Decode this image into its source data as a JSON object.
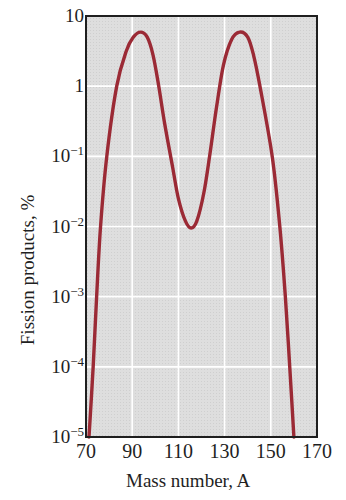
{
  "chart_data": {
    "type": "line",
    "title": "",
    "xlabel": "Mass number, A",
    "ylabel": "Fission products, %",
    "xscale": "linear",
    "yscale": "log",
    "xlim": [
      70,
      170
    ],
    "ylim": [
      1e-05,
      10
    ],
    "grid": true,
    "legend": "none",
    "x_ticks": [
      {
        "value": 70,
        "label": "70"
      },
      {
        "value": 90,
        "label": "90"
      },
      {
        "value": 110,
        "label": "110"
      },
      {
        "value": 130,
        "label": "130"
      },
      {
        "value": 150,
        "label": "150"
      },
      {
        "value": 170,
        "label": "170"
      }
    ],
    "y_ticks": [
      {
        "value": 10,
        "base": "10",
        "exp": ""
      },
      {
        "value": 1,
        "base": "1",
        "exp": ""
      },
      {
        "value": 0.1,
        "base": "10",
        "exp": "−1"
      },
      {
        "value": 0.01,
        "base": "10",
        "exp": "−2"
      },
      {
        "value": 0.001,
        "base": "10",
        "exp": "−3"
      },
      {
        "value": 0.0001,
        "base": "10",
        "exp": "−4"
      },
      {
        "value": 1e-05,
        "base": "10",
        "exp": "−5"
      }
    ],
    "series": [
      {
        "name": "Fission product yield",
        "color": "#9b2a35",
        "x": [
          71.3,
          73.1,
          74.6,
          76.3,
          79.0,
          83.3,
          87.5,
          90.5,
          93.6,
          96.5,
          99.0,
          101.5,
          104.0,
          107.5,
          110.0,
          113.0,
          115.5,
          118.0,
          121.0,
          123.5,
          126.5,
          129.5,
          133.0,
          136.5,
          140.0,
          142.5,
          145.3,
          150.6,
          153.9,
          156.3,
          158.2,
          160.0
        ],
        "y": [
          1e-05,
          0.0001,
          0.001,
          0.01,
          0.1,
          1.0,
          3.2,
          5.0,
          5.9,
          5.0,
          2.8,
          1.0,
          0.3,
          0.07,
          0.025,
          0.012,
          0.0095,
          0.012,
          0.03,
          0.1,
          0.5,
          2.0,
          4.6,
          5.9,
          5.0,
          2.8,
          1.0,
          0.1,
          0.01,
          0.001,
          0.0001,
          1e-05
        ]
      }
    ],
    "annotations": []
  },
  "labels": {
    "xlabel": "Mass number, A",
    "ylabel": "Fission products, %",
    "x_ticks": [
      "70",
      "90",
      "110",
      "130",
      "150",
      "170"
    ],
    "y_ticks": [
      {
        "base": "10",
        "exp": ""
      },
      {
        "base": "1",
        "exp": ""
      },
      {
        "base": "10",
        "exp": "−1"
      },
      {
        "base": "10",
        "exp": "−2"
      },
      {
        "base": "10",
        "exp": "−3"
      },
      {
        "base": "10",
        "exp": "−4"
      },
      {
        "base": "10",
        "exp": "−5"
      }
    ]
  },
  "colors": {
    "curve": "#9b2a35",
    "plot_background": "#dcdcdc",
    "grid": "#ffffff",
    "frame": "#1f1f1f"
  }
}
